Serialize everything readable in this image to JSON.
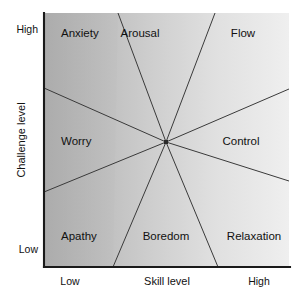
{
  "figure": {
    "type": "sector-diagram",
    "background_color": "#ffffff"
  },
  "axes": {
    "y": {
      "title": "Challenge level",
      "high_label": "High",
      "low_label": "Low"
    },
    "x": {
      "title": "Skill level",
      "low_label": "Low",
      "high_label": "High"
    },
    "axis_color": "#1a1a1a"
  },
  "sectors": [
    {
      "label": "Anxiety",
      "position": "top-left",
      "fill": "#b9b9b9"
    },
    {
      "label": "Arousal",
      "position": "top-center",
      "fill": "#d4d4d4"
    },
    {
      "label": "Flow",
      "position": "top-right",
      "fill": "#eaeaea"
    },
    {
      "label": "Worry",
      "position": "middle-left",
      "fill": "#c2c2c2"
    },
    {
      "label": "Control",
      "position": "middle-right",
      "fill": "#e4e4e4"
    },
    {
      "label": "Apathy",
      "position": "bottom-left",
      "fill": "#b4b4b4"
    },
    {
      "label": "Boredom",
      "position": "bottom-center",
      "fill": "#cfcfcf"
    },
    {
      "label": "Relaxation",
      "position": "bottom-right",
      "fill": "#e0e0e0"
    }
  ],
  "center_point": {
    "x": 166,
    "y": 142
  },
  "colors": {
    "darkest_fill": "#b4b4b4",
    "lightest_fill": "#eeeeee",
    "line": "#3a3a3a",
    "text": "#111111"
  }
}
